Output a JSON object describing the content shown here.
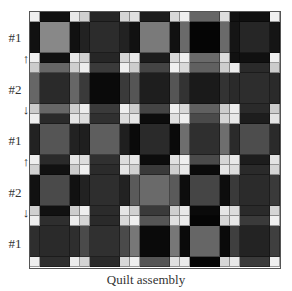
{
  "caption": "Quilt assembly",
  "row_labels": [
    "#1",
    "#2",
    "#1",
    "#2",
    "#1"
  ],
  "arrows": [
    {
      "glyph": "↑",
      "top": 52,
      "name": "arrow-up-icon"
    },
    {
      "glyph": "↓",
      "top": 103,
      "name": "arrow-down-icon"
    },
    {
      "glyph": "↑",
      "top": 155,
      "name": "arrow-up-icon"
    },
    {
      "glyph": "↓",
      "top": 206,
      "name": "arrow-down-icon"
    }
  ],
  "label_positions": [
    30,
    82,
    133,
    185,
    236
  ],
  "grid": {
    "block_rows": 5,
    "block_cols": 5,
    "colors": [
      [
        "#efefef",
        "#111111",
        "#e8e8e8",
        "#d0d0d0",
        "#262626",
        "#d5d5d5",
        "#e0e0e0",
        "#1c1c1c",
        "#d8d8d8",
        "#efefef",
        "#666666",
        "#dddddd",
        "#111111",
        "#101010",
        "#f0f0f0"
      ],
      [
        "#111111",
        "#888888",
        "#111111",
        "#222222",
        "#2c2c2c",
        "#222222",
        "#111111",
        "#7a7a7a",
        "#111111",
        "#6a6a6a",
        "#050505",
        "#6a6a6a",
        "#151515",
        "#262626",
        "#151515"
      ],
      [
        "#f0f0f0",
        "#111111",
        "#e8e8e8",
        "#d0d0d0",
        "#262626",
        "#d5d5d5",
        "#e8e8e8",
        "#1c1c1c",
        "#d8d8d8",
        "#efefef",
        "#6a6a6a",
        "#dddddd",
        "#111111",
        "#101010",
        "#f0f0f0"
      ],
      [
        "#cccccc",
        "#666666",
        "#cfcfcf",
        "#ececec",
        "#3a3a3a",
        "#efefef",
        "#cdcdcd",
        "#444444",
        "#f0f0f0",
        "#d9d9d9",
        "#606060",
        "#cdcdcd",
        "#ececec",
        "#2a2a2a",
        "#cccccc"
      ],
      [
        "#666666",
        "#2a2a2a",
        "#666666",
        "#3a3a3a",
        "#0a0a0a",
        "#3a3a3a",
        "#555555",
        "#1e1e1e",
        "#555555",
        "#333333",
        "#1a1a1a",
        "#333333",
        "#2a2a2a",
        "#2d2d2d",
        "#2a2a2a"
      ],
      [
        "#cccccc",
        "#666666",
        "#cfcfcf",
        "#ececec",
        "#3a3a3a",
        "#efefef",
        "#cdcdcd",
        "#444444",
        "#f0f0f0",
        "#d9d9d9",
        "#606060",
        "#cdcdcd",
        "#ececec",
        "#2a2a2a",
        "#cccccc"
      ],
      [
        "#eeeeee",
        "#2a2a2a",
        "#e5e5e5",
        "#dddddd",
        "#303030",
        "#dcdcdc",
        "#e6e6e6",
        "#0c0c0c",
        "#e0e0e0",
        "#efefef",
        "#4a4a4a",
        "#d5d5d5",
        "#e8e8e8",
        "#1d1d1d",
        "#e3e3e3"
      ],
      [
        "#222222",
        "#555555",
        "#222222",
        "#1f1f1f",
        "#5e5e5e",
        "#1f1f1f",
        "#0a0a0a",
        "#2a2a2a",
        "#0a0a0a",
        "#6e6e6e",
        "#2f2f2f",
        "#6e6e6e",
        "#2a2a2a",
        "#4d4d4d",
        "#2a2a2a"
      ],
      [
        "#eeeeee",
        "#2a2a2a",
        "#e5e5e5",
        "#dddddd",
        "#303030",
        "#dcdcdc",
        "#e6e6e6",
        "#0c0c0c",
        "#e0e0e0",
        "#efefef",
        "#4a4a4a",
        "#d5d5d5",
        "#e8e8e8",
        "#1d1d1d",
        "#e3e3e3"
      ],
      [
        "#d0d0d0",
        "#111111",
        "#cccccc",
        "#efefef",
        "#2b2b2b",
        "#e5e5e5",
        "#d0d0d0",
        "#3a3a3a",
        "#cfcfcf",
        "#e8e8e8",
        "#0a0a0a",
        "#e5e5e5",
        "#dddddd",
        "#2a2a2a",
        "#d5d5d5"
      ],
      [
        "#111111",
        "#4a4a4a",
        "#111111",
        "#222222",
        "#2e2e2e",
        "#222222",
        "#5a5a5a",
        "#6a6a6a",
        "#5a5a5a",
        "#0d0d0d",
        "#454545",
        "#0d0d0d",
        "#3a3a3a",
        "#2b2b2b",
        "#3a3a3a"
      ],
      [
        "#d0d0d0",
        "#111111",
        "#cccccc",
        "#efefef",
        "#2b2b2b",
        "#e5e5e5",
        "#d0d0d0",
        "#3a3a3a",
        "#cfcfcf",
        "#e8e8e8",
        "#0a0a0a",
        "#e5e5e5",
        "#dddddd",
        "#2a2a2a",
        "#d5d5d5"
      ],
      [
        "#eeeeee",
        "#2e2e2e",
        "#ececec",
        "#d4d4d4",
        "#2a2a2a",
        "#d8d8d8",
        "#efefef",
        "#555555",
        "#e0e0e0",
        "#eaeaea",
        "#050505",
        "#d6d6d6",
        "#e8e8e8",
        "#3a3a3a",
        "#f0f0f0"
      ],
      [
        "#2e2e2e",
        "#2a2a2a",
        "#2e2e2e",
        "#4a4a4a",
        "#303030",
        "#4a4a4a",
        "#777777",
        "#0a0a0a",
        "#777777",
        "#0a0a0a",
        "#666666",
        "#0a0a0a",
        "#3f3f3f",
        "#232323",
        "#3f3f3f"
      ],
      [
        "#eeeeee",
        "#2e2e2e",
        "#ececec",
        "#d4d4d4",
        "#2a2a2a",
        "#d8d8d8",
        "#efefef",
        "#555555",
        "#e0e0e0",
        "#eaeaea",
        "#050505",
        "#d6d6d6",
        "#e8e8e8",
        "#3a3a3a",
        "#f0f0f0"
      ]
    ]
  }
}
